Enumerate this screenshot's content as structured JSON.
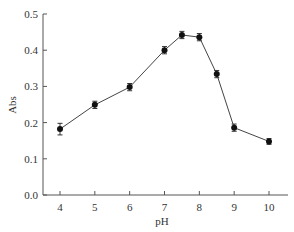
{
  "chart_data": {
    "type": "line",
    "title": "",
    "xlabel": "pH",
    "ylabel": "Abs",
    "xlim": [
      3.5,
      10.5
    ],
    "ylim": [
      0.0,
      0.5
    ],
    "xticks": [
      4,
      5,
      6,
      7,
      8,
      9,
      10
    ],
    "xtick_labels": [
      "4",
      "5",
      "6",
      "7",
      "8",
      "9",
      "10"
    ],
    "yticks": [
      0.0,
      0.1,
      0.2,
      0.3,
      0.4,
      0.5
    ],
    "ytick_labels": [
      "0.0",
      "0.1",
      "0.2",
      "0.3",
      "0.4",
      "0.5"
    ],
    "grid": false,
    "legend": null,
    "series": [
      {
        "name": "Abs",
        "x": [
          4,
          5,
          6,
          7,
          7.5,
          8,
          8.5,
          9,
          10
        ],
        "values": [
          0.182,
          0.249,
          0.298,
          0.4,
          0.442,
          0.436,
          0.334,
          0.186,
          0.148
        ],
        "error": [
          0.016,
          0.01,
          0.01,
          0.01,
          0.01,
          0.01,
          0.01,
          0.01,
          0.008
        ],
        "marker": "circle",
        "color": "#111111"
      }
    ]
  }
}
